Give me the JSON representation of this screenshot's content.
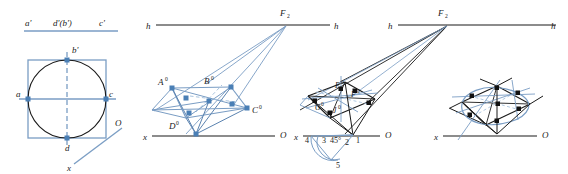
{
  "figure": {
    "colors": {
      "blue": "#7a9dc4",
      "blue_light": "#a8c3de",
      "blue_dark": "#5b83b0",
      "black": "#1a1a1a",
      "node_blue": "#4a7fb5",
      "node_black": "#111111",
      "background": "#ffffff"
    },
    "panels": [
      {
        "id": "panel-1",
        "name": "orthographic-views",
        "labels": {
          "a_prime": "a'",
          "d_b_prime": "d'(b')",
          "c_prime": "c'",
          "a": "a",
          "b_prime": "b'",
          "c": "c",
          "d": "d",
          "x": "x",
          "O": "O"
        }
      },
      {
        "id": "panel-2",
        "name": "perspective-step-1",
        "labels": {
          "h_left": "h",
          "h_right": "h",
          "F2": "F",
          "F2_sub": "2",
          "A0": "A",
          "A0_sup": "0",
          "B0": "B",
          "B0_sup": "0",
          "C0": "C",
          "C0_sup": "0",
          "D0": "D",
          "D0_sup": "0",
          "x": "x",
          "O": "O"
        }
      },
      {
        "id": "panel-3",
        "name": "perspective-step-2",
        "labels": {
          "h_left": "h",
          "h_right": "h",
          "F2": "F",
          "F2_sub": "2",
          "E0": "E",
          "E0_sup": "0",
          "F0": "F",
          "F0_sup": "0",
          "G0": "G",
          "G0_sup": "0",
          "J0": "J",
          "J0_sup": "0",
          "n1": "1",
          "n2": "2",
          "n3": "3",
          "n4": "4",
          "n5": "5",
          "angle": "45°",
          "x": "x",
          "O": "O"
        }
      },
      {
        "id": "panel-4",
        "name": "perspective-result",
        "labels": {
          "h_left": "h",
          "h_right": "h",
          "x": "x",
          "O": "O"
        }
      }
    ]
  }
}
